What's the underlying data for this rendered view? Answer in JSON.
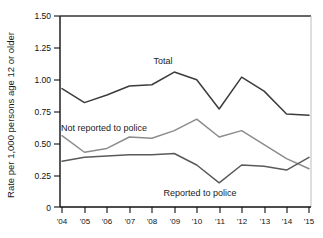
{
  "chart_data": {
    "type": "line",
    "title": "",
    "xlabel": "",
    "ylabel": "Rate per 1,000 persons age 12 or older",
    "x": [
      "'04",
      "'05",
      "'06",
      "'07",
      "'08",
      "'09",
      "'10",
      "'11",
      "'12",
      "'13",
      "'14",
      "'15"
    ],
    "x_full_years": [
      2004,
      2005,
      2006,
      2007,
      2008,
      2009,
      2010,
      2011,
      2012,
      2013,
      2014,
      2015
    ],
    "ylim": [
      0,
      1.5
    ],
    "xlim_labels": [
      "'04",
      "'15"
    ],
    "ytick_labels": [
      "0",
      "0.25",
      "0.50",
      "0.75",
      "1.00",
      "1.25",
      "1.50"
    ],
    "ytick_values": [
      0,
      0.25,
      0.5,
      0.75,
      1.0,
      1.25,
      1.5
    ],
    "grid": false,
    "legend_position": "inline-annotations",
    "series": [
      {
        "name": "Total",
        "color": "#3c3c3c",
        "values": [
          0.93,
          0.82,
          0.88,
          0.95,
          0.96,
          1.06,
          1.0,
          0.77,
          1.02,
          0.91,
          0.73,
          0.72
        ],
        "annotation": {
          "label": "Total",
          "x_near": "'09",
          "value_near": 1.18
        }
      },
      {
        "name": "Not reported to police",
        "color": "#8c8c8c",
        "values": [
          0.56,
          0.43,
          0.46,
          0.55,
          0.54,
          0.6,
          0.69,
          0.55,
          0.6,
          0.49,
          0.38,
          0.3
        ],
        "annotation": {
          "label": "Not reported to police",
          "x_near": "'05",
          "value_near": 0.64
        }
      },
      {
        "name": "Reported to police",
        "color": "#5a5a5a",
        "values": [
          0.36,
          0.39,
          0.4,
          0.41,
          0.41,
          0.42,
          0.33,
          0.19,
          0.33,
          0.32,
          0.29,
          0.39
        ],
        "annotation": {
          "label": "Reported to police",
          "x_near": "'11",
          "value_near": 0.08
        }
      }
    ]
  },
  "axis": {
    "y_label": "Rate per 1,000 persons age 12 or older"
  },
  "annotations": {
    "total": "Total",
    "not_reported": "Not reported to police",
    "reported": "Reported to police"
  },
  "ticks": {
    "y": [
      "1.50",
      "1.25",
      "1.00",
      "0.75",
      "0.50",
      "0.25",
      "0"
    ],
    "x": [
      "'04",
      "'05",
      "'06",
      "'07",
      "'08",
      "'09",
      "'10",
      "'11",
      "'12",
      "'13",
      "'14",
      "'15"
    ]
  },
  "colors": {
    "total_line": "#3c3c3c",
    "not_reported_line": "#8c8c8c",
    "reported_line": "#5a5a5a",
    "axis": "#111111",
    "background": "#ffffff"
  }
}
